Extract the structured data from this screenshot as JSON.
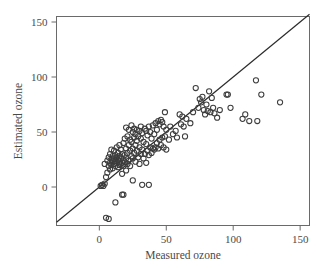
{
  "chart_data": {
    "type": "scatter",
    "title": "",
    "xlabel": "Measured ozone",
    "ylabel": "Estimated ozone",
    "xlim": [
      -32,
      157
    ],
    "ylim": [
      -35,
      155
    ],
    "xticks": [
      0,
      50,
      100,
      150
    ],
    "yticks": [
      0,
      50,
      100,
      150
    ],
    "xtick_labels": [
      "0",
      "50",
      "100",
      "150"
    ],
    "ytick_labels": [
      "0",
      "50",
      "100",
      "150"
    ],
    "grid": false,
    "legend": null,
    "reference_line": {
      "description": "one-to-one identity line y = x",
      "slope": 1,
      "intercept": 0,
      "x_start": -32,
      "x_end": 157
    },
    "marker_style": "open-circle",
    "marker_radius_px": 2.6,
    "points": [
      [
        1,
        1
      ],
      [
        2,
        2
      ],
      [
        3,
        1
      ],
      [
        4,
        3
      ],
      [
        4,
        21
      ],
      [
        5,
        -28
      ],
      [
        5,
        9
      ],
      [
        6,
        13
      ],
      [
        6,
        24
      ],
      [
        7,
        -29
      ],
      [
        7,
        19
      ],
      [
        7,
        27
      ],
      [
        8,
        16
      ],
      [
        8,
        22
      ],
      [
        8,
        30
      ],
      [
        9,
        20
      ],
      [
        9,
        25
      ],
      [
        9,
        34
      ],
      [
        10,
        17
      ],
      [
        10,
        23
      ],
      [
        10,
        28
      ],
      [
        11,
        21
      ],
      [
        11,
        26
      ],
      [
        11,
        33
      ],
      [
        12,
        -14
      ],
      [
        12,
        19
      ],
      [
        12,
        24
      ],
      [
        12,
        29
      ],
      [
        13,
        22
      ],
      [
        13,
        27
      ],
      [
        13,
        36
      ],
      [
        14,
        18
      ],
      [
        14,
        25
      ],
      [
        14,
        31
      ],
      [
        15,
        20
      ],
      [
        15,
        23
      ],
      [
        15,
        28
      ],
      [
        15,
        38
      ],
      [
        16,
        21
      ],
      [
        16,
        26
      ],
      [
        16,
        34
      ],
      [
        17,
        -7
      ],
      [
        17,
        12
      ],
      [
        17,
        22
      ],
      [
        17,
        30
      ],
      [
        18,
        -7
      ],
      [
        18,
        19
      ],
      [
        18,
        24
      ],
      [
        18,
        40
      ],
      [
        19,
        23
      ],
      [
        19,
        29
      ],
      [
        19,
        44
      ],
      [
        20,
        15
      ],
      [
        20,
        26
      ],
      [
        20,
        35
      ],
      [
        20,
        54
      ],
      [
        21,
        21
      ],
      [
        21,
        31
      ],
      [
        21,
        46
      ],
      [
        22,
        24
      ],
      [
        22,
        38
      ],
      [
        22,
        52
      ],
      [
        23,
        19
      ],
      [
        23,
        33
      ],
      [
        23,
        43
      ],
      [
        24,
        28
      ],
      [
        24,
        41
      ],
      [
        24,
        56
      ],
      [
        25,
        6
      ],
      [
        25,
        26
      ],
      [
        25,
        35
      ],
      [
        25,
        50
      ],
      [
        26,
        31
      ],
      [
        26,
        45
      ],
      [
        26,
        53
      ],
      [
        27,
        23
      ],
      [
        27,
        38
      ],
      [
        27,
        48
      ],
      [
        28,
        33
      ],
      [
        28,
        42
      ],
      [
        28,
        52
      ],
      [
        29,
        27
      ],
      [
        29,
        46
      ],
      [
        30,
        21
      ],
      [
        30,
        36
      ],
      [
        30,
        51
      ],
      [
        31,
        30
      ],
      [
        31,
        44
      ],
      [
        31,
        55
      ],
      [
        32,
        2
      ],
      [
        32,
        34
      ],
      [
        32,
        49
      ],
      [
        33,
        26
      ],
      [
        33,
        41
      ],
      [
        34,
        30
      ],
      [
        34,
        53
      ],
      [
        35,
        22
      ],
      [
        35,
        39
      ],
      [
        35,
        51
      ],
      [
        36,
        33
      ],
      [
        36,
        47
      ],
      [
        37,
        2
      ],
      [
        37,
        29
      ],
      [
        37,
        55
      ],
      [
        38,
        36
      ],
      [
        38,
        50
      ],
      [
        39,
        31
      ],
      [
        39,
        44
      ],
      [
        40,
        35
      ],
      [
        40,
        56
      ],
      [
        41,
        34
      ],
      [
        41,
        48
      ],
      [
        42,
        36
      ],
      [
        42,
        58
      ],
      [
        43,
        40
      ],
      [
        43,
        52
      ],
      [
        44,
        35
      ],
      [
        44,
        60
      ],
      [
        45,
        43
      ],
      [
        45,
        57
      ],
      [
        46,
        38
      ],
      [
        46,
        61
      ],
      [
        47,
        45
      ],
      [
        47,
        59
      ],
      [
        48,
        36
      ],
      [
        48,
        55
      ],
      [
        49,
        46
      ],
      [
        49,
        68
      ],
      [
        50,
        34
      ],
      [
        50,
        52
      ],
      [
        52,
        43
      ],
      [
        53,
        55
      ],
      [
        55,
        48
      ],
      [
        57,
        51
      ],
      [
        58,
        45
      ],
      [
        60,
        66
      ],
      [
        61,
        57
      ],
      [
        62,
        64
      ],
      [
        63,
        55
      ],
      [
        64,
        46
      ],
      [
        65,
        62
      ],
      [
        68,
        58
      ],
      [
        70,
        68
      ],
      [
        72,
        90
      ],
      [
        74,
        72
      ],
      [
        75,
        80
      ],
      [
        76,
        77
      ],
      [
        77,
        82
      ],
      [
        78,
        70
      ],
      [
        79,
        66
      ],
      [
        80,
        75
      ],
      [
        81,
        69
      ],
      [
        82,
        87
      ],
      [
        83,
        68
      ],
      [
        84,
        81
      ],
      [
        85,
        72
      ],
      [
        86,
        67
      ],
      [
        88,
        63
      ],
      [
        90,
        70
      ],
      [
        95,
        84
      ],
      [
        96,
        84
      ],
      [
        98,
        72
      ],
      [
        107,
        62
      ],
      [
        109,
        66
      ],
      [
        112,
        60
      ],
      [
        117,
        97
      ],
      [
        118,
        60
      ],
      [
        121,
        84
      ],
      [
        135,
        77
      ]
    ]
  }
}
